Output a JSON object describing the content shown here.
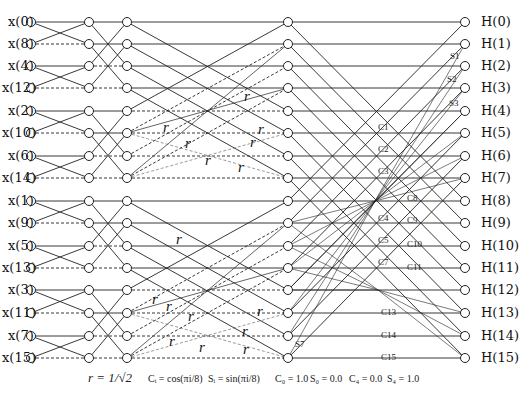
{
  "diagram": {
    "type": "signal-flow-graph",
    "inputs": [
      "x(0)",
      "x(8)",
      "x(4)",
      "x(12)",
      "x(2)",
      "x(10)",
      "x(6)",
      "x(14)",
      "x(1)",
      "x(9)",
      "x(5)",
      "x(13)",
      "x(3)",
      "x(11)",
      "x(7)",
      "x(15)"
    ],
    "outputs": [
      "H(0)",
      "H(1)",
      "H(2)",
      "H(3)",
      "H(4)",
      "H(5)",
      "H(6)",
      "H(7)",
      "H(8)",
      "H(9)",
      "H(10)",
      "H(11)",
      "H(12)",
      "H(13)",
      "H(14)",
      "H(15)"
    ],
    "r_label": "r",
    "coeff_labels_left": [
      "C1",
      "C2",
      "C3",
      "C4",
      "C5",
      "C6",
      "C7"
    ],
    "coeff_labels_right": [
      "C8",
      "C9",
      "C10",
      "C11"
    ],
    "coeff_labels_bottom": [
      "C13",
      "C14",
      "C15"
    ],
    "sin_labels": [
      "S1",
      "S2",
      "S3",
      "S7"
    ],
    "footer": {
      "r_def": "r = 1/√2",
      "c_def": "Cᵢ = cos(πi/8)",
      "s_def": "Sᵢ = sin(πi/8)",
      "c0": "C₀ = 1.0",
      "s0": "S₀ = 0.0",
      "c4": "C₄ = 0.0",
      "s4": "S₄ = 1.0"
    }
  }
}
